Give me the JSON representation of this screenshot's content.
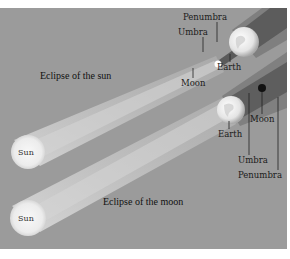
{
  "diagram": {
    "background_color": "#9b9b9b",
    "sun_color": "#f2f2f2",
    "shadow_dark": "#5e5e5e",
    "shadow_mid": "#7d7d7d",
    "beam_light": "#c4c4c4",
    "eclipse_of_sun": {
      "title": "Eclipse of the sun",
      "sun_label": "Sun",
      "labels": {
        "penumbra": "Penumbra",
        "umbra": "Umbra",
        "earth": "Earth",
        "moon": "Moon"
      }
    },
    "eclipse_of_moon": {
      "title": "Eclipse of the moon",
      "sun_label": "Sun",
      "labels": {
        "earth": "Earth",
        "moon": "Moon",
        "umbra": "Umbra",
        "penumbra": "Penumbra"
      }
    }
  }
}
